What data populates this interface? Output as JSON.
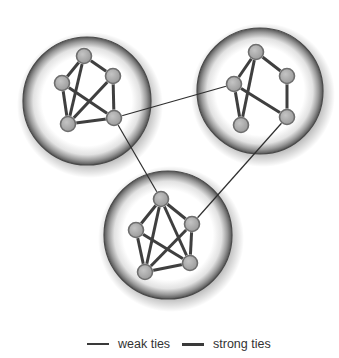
{
  "colors": {
    "background": "#ffffff",
    "node_fill": "#a9a9a9",
    "node_stroke": "#6e6e6e",
    "strong_tie": "#3f3f3f",
    "weak_tie": "#2e2e2e",
    "cluster_rim": "#8c8c8c",
    "cluster_outline": "#4a4a4a"
  },
  "clusters": [
    {
      "id": "left",
      "cx": 87,
      "cy": 101,
      "r": 64,
      "nodes": [
        {
          "id": "top",
          "x": 84,
          "y": 56
        },
        {
          "id": "right",
          "x": 113,
          "y": 76
        },
        {
          "id": "left",
          "x": 62,
          "y": 83
        },
        {
          "id": "bottom-left",
          "x": 68,
          "y": 124
        },
        {
          "id": "bottom-right",
          "x": 114,
          "y": 118
        }
      ],
      "strong_ties": [
        [
          "top",
          "left"
        ],
        [
          "top",
          "right"
        ],
        [
          "top",
          "bottom-left"
        ],
        [
          "left",
          "bottom-left"
        ],
        [
          "left",
          "bottom-right"
        ],
        [
          "right",
          "bottom-left"
        ],
        [
          "right",
          "bottom-right"
        ],
        [
          "bottom-left",
          "bottom-right"
        ]
      ]
    },
    {
      "id": "right",
      "cx": 260,
      "cy": 91,
      "r": 63,
      "nodes": [
        {
          "id": "top",
          "x": 256,
          "y": 52
        },
        {
          "id": "right",
          "x": 287,
          "y": 76
        },
        {
          "id": "left",
          "x": 234,
          "y": 84
        },
        {
          "id": "bottom-left",
          "x": 241,
          "y": 125
        },
        {
          "id": "bottom-right",
          "x": 287,
          "y": 117
        }
      ],
      "strong_ties": [
        [
          "top",
          "left"
        ],
        [
          "top",
          "right"
        ],
        [
          "top",
          "bottom-left"
        ],
        [
          "left",
          "bottom-left"
        ],
        [
          "left",
          "bottom-right"
        ],
        [
          "right",
          "bottom-right"
        ]
      ]
    },
    {
      "id": "bottom",
      "cx": 168,
      "cy": 235,
      "r": 64,
      "nodes": [
        {
          "id": "top",
          "x": 161,
          "y": 199
        },
        {
          "id": "right",
          "x": 192,
          "y": 224
        },
        {
          "id": "left",
          "x": 136,
          "y": 230
        },
        {
          "id": "bottom-left",
          "x": 145,
          "y": 272
        },
        {
          "id": "bottom-right",
          "x": 190,
          "y": 263
        }
      ],
      "strong_ties": [
        [
          "top",
          "left"
        ],
        [
          "top",
          "right"
        ],
        [
          "top",
          "bottom-left"
        ],
        [
          "top",
          "bottom-right"
        ],
        [
          "left",
          "bottom-left"
        ],
        [
          "left",
          "bottom-right"
        ],
        [
          "right",
          "bottom-left"
        ],
        [
          "right",
          "bottom-right"
        ],
        [
          "bottom-left",
          "bottom-right"
        ]
      ]
    }
  ],
  "weak_ties": [
    {
      "from": {
        "x": 114,
        "y": 118
      },
      "to": {
        "x": 234,
        "y": 84
      }
    },
    {
      "from": {
        "x": 114,
        "y": 118
      },
      "to": {
        "x": 161,
        "y": 199
      }
    },
    {
      "from": {
        "x": 287,
        "y": 117
      },
      "to": {
        "x": 192,
        "y": 224
      }
    }
  ],
  "legend": {
    "weak_label": "weak ties",
    "strong_label": "strong ties"
  }
}
